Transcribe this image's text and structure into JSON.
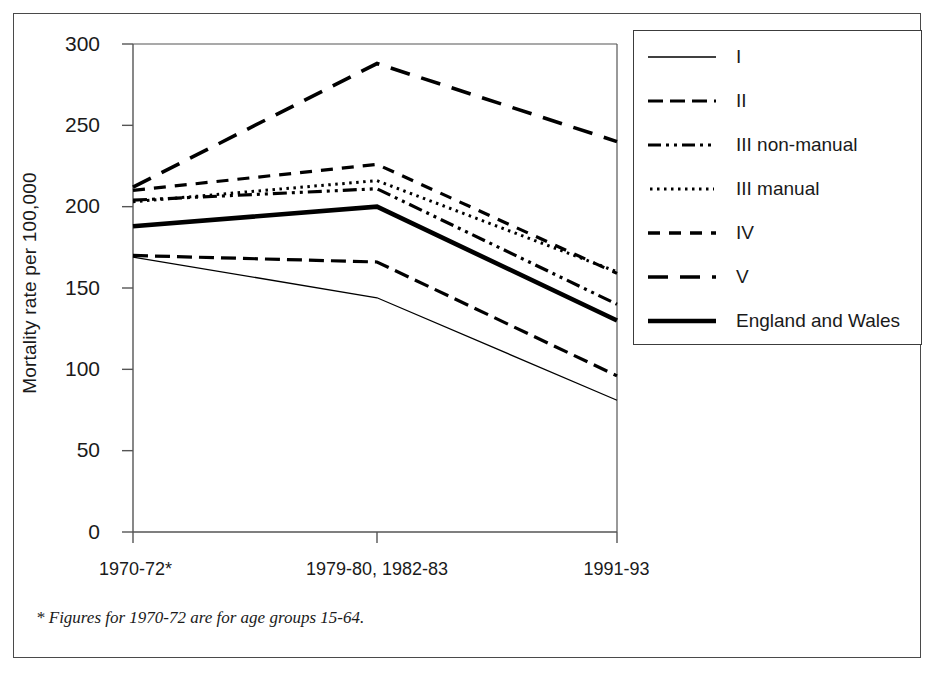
{
  "figure": {
    "footnote": "* Figures for 1970-72 are for age groups 15-64."
  },
  "chart_data": {
    "type": "line",
    "title": "",
    "xlabel": "",
    "ylabel": "Mortality rate per 100,000",
    "categories": [
      "1970-72*",
      "1979-80, 1982-83",
      "1991-93"
    ],
    "x_tick_labels": [
      "1970-72*",
      "1979-80, 1982-83",
      "1991-93"
    ],
    "y_tick_labels": [
      "0",
      "50",
      "100",
      "150",
      "200",
      "250",
      "300"
    ],
    "y_ticks": [
      0,
      50,
      100,
      150,
      200,
      250,
      300
    ],
    "ylim": [
      0,
      300
    ],
    "grid": false,
    "legend_position": "right-outside",
    "series": [
      {
        "name": "I",
        "label": "I",
        "style": "solid-thin",
        "color": "#000000",
        "values": [
          169,
          144,
          81
        ]
      },
      {
        "name": "II",
        "label": "II",
        "style": "dash-dot",
        "color": "#000000",
        "values": [
          170,
          166,
          96
        ]
      },
      {
        "name": "III non-manual",
        "label": "III non-manual",
        "style": "dash-dot-dot",
        "color": "#000000",
        "values": [
          204,
          211,
          140
        ]
      },
      {
        "name": "III manual",
        "label": "III manual",
        "style": "dotted",
        "color": "#000000",
        "values": [
          203,
          216,
          160
        ]
      },
      {
        "name": "IV",
        "label": "IV",
        "style": "short-dash",
        "color": "#000000",
        "values": [
          210,
          226,
          159
        ]
      },
      {
        "name": "V",
        "label": "V",
        "style": "long-dash",
        "color": "#000000",
        "values": [
          212,
          288,
          240
        ]
      },
      {
        "name": "England and Wales",
        "label": "England and Wales",
        "style": "solid-thick",
        "color": "#000000",
        "values": [
          188,
          200,
          130
        ]
      }
    ]
  }
}
